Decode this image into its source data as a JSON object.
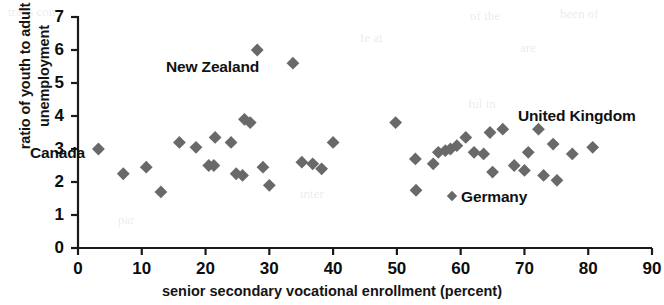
{
  "chart_data": {
    "type": "scatter",
    "title": "",
    "xlabel": "senior secondary vocational enrollment (percent)",
    "ylabel_line1": "ratio of youth to adult",
    "ylabel_line2": "unemployment",
    "xlim": [
      0,
      90
    ],
    "ylim": [
      0,
      7
    ],
    "xticks": [
      0,
      10,
      20,
      30,
      40,
      50,
      60,
      70,
      80,
      90
    ],
    "yticks": [
      0,
      1,
      2,
      3,
      4,
      5,
      6,
      7
    ],
    "grid": false,
    "legend": "none",
    "marker": "diamond",
    "marker_color": "#696969",
    "axis_color": "#1a1a1a",
    "points": [
      {
        "x": 3.2,
        "y": 3.0
      },
      {
        "x": 7.1,
        "y": 2.25
      },
      {
        "x": 10.7,
        "y": 2.45
      },
      {
        "x": 13.0,
        "y": 1.7
      },
      {
        "x": 15.9,
        "y": 3.2
      },
      {
        "x": 18.5,
        "y": 3.05
      },
      {
        "x": 20.5,
        "y": 2.5
      },
      {
        "x": 21.5,
        "y": 3.35
      },
      {
        "x": 21.3,
        "y": 2.5
      },
      {
        "x": 24.0,
        "y": 3.2
      },
      {
        "x": 24.8,
        "y": 2.25
      },
      {
        "x": 25.8,
        "y": 2.2
      },
      {
        "x": 26.1,
        "y": 3.9
      },
      {
        "x": 27.0,
        "y": 3.8
      },
      {
        "x": 28.1,
        "y": 6.0
      },
      {
        "x": 29.0,
        "y": 2.45
      },
      {
        "x": 30.0,
        "y": 1.9
      },
      {
        "x": 33.7,
        "y": 5.6
      },
      {
        "x": 35.1,
        "y": 2.6
      },
      {
        "x": 36.8,
        "y": 2.55
      },
      {
        "x": 38.2,
        "y": 2.4
      },
      {
        "x": 40.0,
        "y": 3.2
      },
      {
        "x": 49.8,
        "y": 3.8
      },
      {
        "x": 52.9,
        "y": 2.7
      },
      {
        "x": 53.0,
        "y": 1.75
      },
      {
        "x": 55.7,
        "y": 2.55
      },
      {
        "x": 56.5,
        "y": 2.9
      },
      {
        "x": 57.6,
        "y": 2.95
      },
      {
        "x": 58.4,
        "y": 3.0
      },
      {
        "x": 59.4,
        "y": 3.1
      },
      {
        "x": 60.8,
        "y": 3.35
      },
      {
        "x": 62.1,
        "y": 2.9
      },
      {
        "x": 63.6,
        "y": 2.85
      },
      {
        "x": 64.6,
        "y": 3.5
      },
      {
        "x": 65.0,
        "y": 2.3
      },
      {
        "x": 66.6,
        "y": 3.6
      },
      {
        "x": 68.4,
        "y": 2.5
      },
      {
        "x": 70.0,
        "y": 2.35
      },
      {
        "x": 70.6,
        "y": 2.9
      },
      {
        "x": 72.2,
        "y": 3.6
      },
      {
        "x": 73.0,
        "y": 2.2
      },
      {
        "x": 74.5,
        "y": 3.15
      },
      {
        "x": 75.1,
        "y": 2.05
      },
      {
        "x": 77.5,
        "y": 2.85
      },
      {
        "x": 80.7,
        "y": 3.05
      }
    ],
    "annotations": [
      {
        "label": "Canada",
        "x_px": 30,
        "y_px": 144,
        "data_x": 4.0,
        "data_y": 3.2
      },
      {
        "label": "New Zealand",
        "x_px": 166,
        "y_px": 58,
        "data_x": 22.0,
        "data_y": 5.5
      },
      {
        "label": "United Kingdom",
        "x_px": 518,
        "y_px": 107,
        "data_x": 70.0,
        "data_y": 4.0
      },
      {
        "label": "Germany",
        "x_px": 461,
        "y_px": 188,
        "data_x": 63.5,
        "data_y": 1.5
      }
    ]
  },
  "ghost_text": [
    {
      "t": "trans con",
      "x": 8,
      "y": 4
    },
    {
      "t": "of the",
      "x": 470,
      "y": 8
    },
    {
      "t": "been of",
      "x": 560,
      "y": 6
    },
    {
      "t": "fe at",
      "x": 360,
      "y": 30
    },
    {
      "t": "are",
      "x": 520,
      "y": 40
    },
    {
      "t": "ful in",
      "x": 468,
      "y": 96
    },
    {
      "t": "par",
      "x": 118,
      "y": 212
    },
    {
      "t": "inter",
      "x": 300,
      "y": 186
    }
  ]
}
